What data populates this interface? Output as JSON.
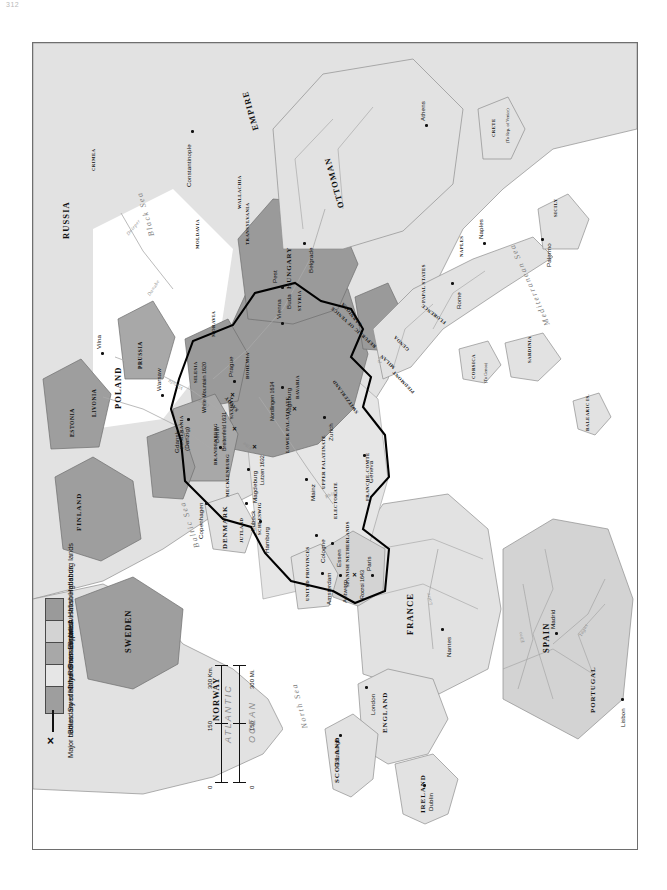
{
  "folio": "312",
  "legend": {
    "title": "Map legend",
    "items": [
      {
        "label": "Austrian Habsburg lands",
        "color": "#9a9a9a",
        "symbol": "swatch"
      },
      {
        "label": "Spanish Habsburg lands",
        "color": "#d3d3d3",
        "symbol": "swatch"
      },
      {
        "label": "Prussian lands",
        "color": "#a8a8a8",
        "symbol": "swatch"
      },
      {
        "label": "Other German states",
        "color": "#e6e6e6",
        "symbol": "swatch"
      },
      {
        "label": "Swedish lands",
        "color": "#9e9e9e",
        "symbol": "swatch"
      },
      {
        "label": "Boundary of Holy Roman Empire",
        "color": "#000000",
        "symbol": "line"
      },
      {
        "label": "Major battles",
        "color": "#000000",
        "symbol": "x"
      }
    ]
  },
  "scale": {
    "km_unit": "300 Km.",
    "mi_unit": "300 Mi.",
    "km_ticks": [
      "0",
      "150",
      "300 Km."
    ],
    "mi_ticks": [
      "0",
      "150",
      "300 Mi."
    ]
  },
  "oceans": [
    {
      "name": "ATLANTIC"
    },
    {
      "name": "OCEAN"
    }
  ],
  "seas": [
    {
      "name": "North Sea"
    },
    {
      "name": "Baltic Sea"
    },
    {
      "name": "Black Sea"
    },
    {
      "name": "Mediterranean Sea"
    }
  ],
  "countries": [
    "RUSSIA",
    "POLAND",
    "SWEDEN",
    "NORWAY",
    "DENMARK",
    "FINLAND",
    "SCOTLAND",
    "ENGLAND",
    "IRELAND",
    "FRANCE",
    "SPAIN",
    "PORTUGAL",
    "HUNGARY",
    "OTTOMAN",
    "EMPIRE",
    "PRUSSIA"
  ],
  "regions": [
    "ESTONIA",
    "LIVONIA",
    "JUTLAND",
    "SCHLESWIG",
    "MECKLENBURG",
    "POMERANIA",
    "BRANDENBURG",
    "SAXONY",
    "SILESIA",
    "BOHEMIA",
    "MORAVIA",
    "STYRIA",
    "CARNIOLA",
    "BAVARIA",
    "LOWER PALATINATE",
    "UPPER PALATINATE",
    "UNITED PROVINCES",
    "SPANISH NETHERLANDS",
    "FRANCHE-COMTE",
    "SWITZERLAND",
    "SAVOY",
    "PIEDMONT",
    "MILAN",
    "GENOA",
    "FLORENCE",
    "PAPAL STATES",
    "NAPLES",
    "SICILY",
    "SARDINIA",
    "MOLDAVIA",
    "WALLACHIA",
    "TRANSYLVANIA",
    "CRIMEA",
    "REPUBLIC OF VENICE",
    "ELECTORATE",
    "CRETE",
    "CORSICA",
    "BALEARIC IS."
  ],
  "region_notes": [
    {
      "name": "CRETE",
      "note": "(To Rep. of Venice)"
    },
    {
      "name": "CORSICA",
      "note": "(To Genoa)"
    }
  ],
  "cities": [
    "Vilna",
    "Warsaw",
    "Gdansk",
    "(Danzig)",
    "Copenhagen",
    "Lubeck",
    "Hamburg",
    "Berlin",
    "Magdeburg",
    "Prague",
    "Vienna",
    "Buda",
    "Pest",
    "Belgrade",
    "Constantinople",
    "Athens",
    "Rome",
    "Naples",
    "Palermo",
    "Madrid",
    "Lisbon",
    "Paris",
    "Nantes",
    "London",
    "Edinburgh",
    "Dublin",
    "Amsterdam",
    "Antwerp",
    "Cologne",
    "Mainz",
    "Augsburg",
    "Zurich",
    "Geneva",
    "Essen"
  ],
  "battles": [
    {
      "name": "Breitenfeld",
      "year": "1631",
      "label": "Breitenfeld 1631"
    },
    {
      "name": "Lutzen",
      "year": "1632",
      "label": "Lutzen 1632"
    },
    {
      "name": "White Mountain",
      "year": "1620",
      "label": "White Mountain 1620"
    },
    {
      "name": "Nordlingen",
      "year": "1634",
      "label": "Nordlingen 1634"
    },
    {
      "name": "Rocroi",
      "year": "1643",
      "label": "Rocroi 1643"
    }
  ],
  "rivers": [
    "Rhine",
    "Danube",
    "Elbe",
    "Oder",
    "Vistula",
    "Dnieper",
    "Loire",
    "Ebro",
    "Tagus",
    "Po"
  ],
  "colors": {
    "austrian_habsburg": "#9a9a9a",
    "spanish_habsburg": "#d3d3d3",
    "prussian": "#a8a8a8",
    "other_german": "#e6e6e6",
    "swedish": "#9e9e9e",
    "generic_land": "#e2e2e2",
    "water": "#ffffff",
    "border": "#8e8e8e",
    "hre_boundary": "#000000"
  }
}
